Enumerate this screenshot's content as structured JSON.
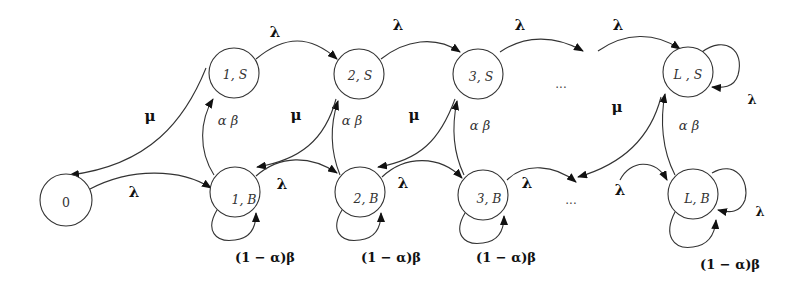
{
  "diagram": {
    "type": "state-transition-diagram",
    "nodes": [
      {
        "id": "0",
        "label": "0",
        "cx": 66,
        "cy": 200
      },
      {
        "id": "1S",
        "label": "1, S",
        "cx": 234,
        "cy": 73
      },
      {
        "id": "2S",
        "label": "2, S",
        "cx": 359,
        "cy": 74
      },
      {
        "id": "3S",
        "label": "3, S",
        "cx": 478,
        "cy": 74
      },
      {
        "id": "LS",
        "label": "L , S",
        "cx": 688,
        "cy": 72
      },
      {
        "id": "1B",
        "label": "1, B",
        "cx": 235,
        "cy": 192
      },
      {
        "id": "2B",
        "label": "2, B",
        "cx": 360,
        "cy": 192
      },
      {
        "id": "3B",
        "label": "3, B",
        "cx": 483,
        "cy": 195
      },
      {
        "id": "LB",
        "label": "L, B",
        "cx": 693,
        "cy": 194
      }
    ],
    "ellipsis_top": "...",
    "ellipsis_bottom": "...",
    "edge_labels": {
      "lambda": "λ",
      "mu": "μ",
      "alpha_beta": "α β",
      "one_minus_alpha_beta": "(1 − α)β"
    },
    "edges": [
      {
        "from": "0",
        "to": "1B",
        "label": "λ"
      },
      {
        "from": "1S",
        "to": "0",
        "label": "μ"
      },
      {
        "from": "1S",
        "to": "2S",
        "label": "λ"
      },
      {
        "from": "2S",
        "to": "3S",
        "label": "λ"
      },
      {
        "from": "3S",
        "to": "...",
        "label": "λ"
      },
      {
        "from": "...",
        "to": "LS",
        "label": "λ"
      },
      {
        "from": "LS",
        "to": "LS",
        "label": "λ"
      },
      {
        "from": "1B",
        "to": "1S",
        "label": "α β"
      },
      {
        "from": "2B",
        "to": "2S",
        "label": "α β"
      },
      {
        "from": "3B",
        "to": "3S",
        "label": "α β"
      },
      {
        "from": "LB",
        "to": "LS",
        "label": "α β"
      },
      {
        "from": "2S",
        "to": "1B",
        "label": "μ"
      },
      {
        "from": "3S",
        "to": "2B",
        "label": "μ"
      },
      {
        "from": "LS",
        "to": "...",
        "label": "μ"
      },
      {
        "from": "1B",
        "to": "2B",
        "label": "λ"
      },
      {
        "from": "2B",
        "to": "3B",
        "label": "λ"
      },
      {
        "from": "3B",
        "to": "...",
        "label": "λ"
      },
      {
        "from": "...",
        "to": "LB",
        "label": "λ"
      },
      {
        "from": "LB",
        "to": "LB",
        "label": "λ"
      },
      {
        "from": "1B",
        "to": "1B",
        "label": "(1 − α)β"
      },
      {
        "from": "2B",
        "to": "2B",
        "label": "(1 − α)β"
      },
      {
        "from": "3B",
        "to": "3B",
        "label": "(1 − α)β"
      },
      {
        "from": "LB",
        "to": "LB",
        "label": "(1 − α)β"
      }
    ]
  }
}
